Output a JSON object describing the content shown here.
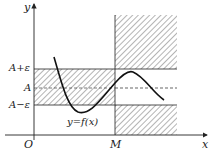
{
  "diagram": {
    "title": "",
    "axes": {
      "x_label": "x",
      "y_label": "y",
      "origin_label": "O"
    },
    "y_ticks": [
      {
        "label": "A+ε",
        "role": "upper-bound"
      },
      {
        "label": "A",
        "role": "limit"
      },
      {
        "label": "A−ε",
        "role": "lower-bound"
      }
    ],
    "x_ticks": [
      {
        "label": "M",
        "role": "threshold"
      }
    ],
    "curve_label": "y=f(x)",
    "colors": {
      "stroke": "#222222",
      "hatch": "#444444",
      "background": "#ffffff"
    }
  }
}
